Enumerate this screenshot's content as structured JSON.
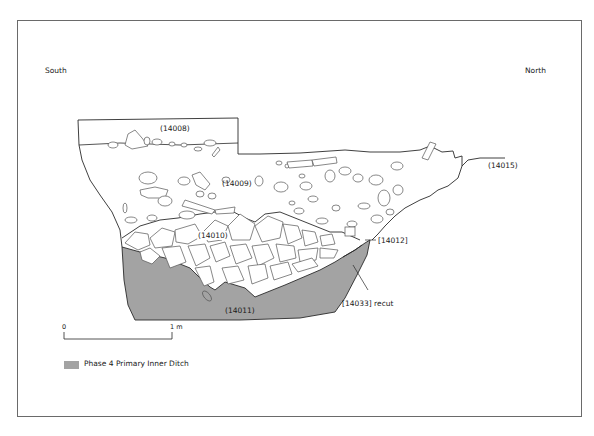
{
  "figure": {
    "orientation": {
      "left": "South",
      "right": "North"
    },
    "contexts": [
      {
        "id": "14008",
        "label": "(14008)"
      },
      {
        "id": "14009",
        "label": "(14009)"
      },
      {
        "id": "14010",
        "label": "(14010)"
      },
      {
        "id": "14011",
        "label": "(14011)"
      },
      {
        "id": "14015",
        "label": "(14015)"
      }
    ],
    "cuts": [
      {
        "id": "14012",
        "label": "[14012]"
      },
      {
        "id": "14033",
        "label": "[14033] recut"
      }
    ],
    "scale_bar": {
      "start": "0",
      "end": "1 m"
    },
    "legend": {
      "label": "Phase 4 Primary Inner Ditch",
      "color": "#a3a3a3"
    },
    "colors": {
      "fill": "#a3a3a3",
      "line": "#2a2a2a",
      "stone": "#555555",
      "frame": "#6a6a6a"
    }
  }
}
